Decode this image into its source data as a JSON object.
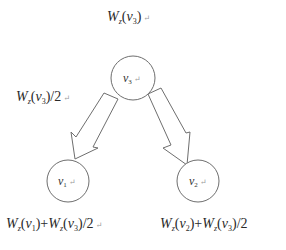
{
  "diagram": {
    "type": "tree-weight-distribution",
    "colors": {
      "stroke": "#6e6e6e",
      "text": "#2a2a2a",
      "background": "#ffffff",
      "return_mark": "#999999"
    },
    "nodes": [
      {
        "id": "v3",
        "base": "v",
        "sub": "3",
        "mark": "↵",
        "cx": 133,
        "cy": 78,
        "r": 22
      },
      {
        "id": "v1",
        "base": "v",
        "sub": "1",
        "mark": "↵",
        "cx": 68,
        "cy": 181,
        "r": 21
      },
      {
        "id": "v2",
        "base": "v",
        "sub": "2",
        "mark": "↵",
        "cx": 198,
        "cy": 181,
        "r": 21
      }
    ],
    "edges": [
      {
        "from": "v3",
        "to": "v1",
        "style": "hollow-block-arrow"
      },
      {
        "from": "v3",
        "to": "v2",
        "style": "hollow-block-arrow"
      }
    ],
    "labels": {
      "top": {
        "W": "W",
        "z": "z",
        "v": "v",
        "sub": "3",
        "text": "W_z(v_3)",
        "mark": "↵"
      },
      "edge_left": {
        "W": "W",
        "z": "z",
        "v": "v",
        "sub": "3",
        "suffix": "/2",
        "text": "W_z(v_3)/2",
        "mark": "↵"
      },
      "bottom_left": {
        "text": "W_z(v_1)+W_z(v_3)/2",
        "t1": {
          "W": "W",
          "z": "z",
          "v": "v",
          "sub": "1"
        },
        "plus": "+",
        "t2": {
          "W": "W",
          "z": "z",
          "v": "v",
          "sub": "3"
        },
        "suffix": "/2",
        "mark": "↵"
      },
      "bottom_right": {
        "text": "W_z(v_2)+W_z(v_3)/2",
        "t1": {
          "W": "W",
          "z": "z",
          "v": "v",
          "sub": "2"
        },
        "plus": "+",
        "t2": {
          "W": "W",
          "z": "z",
          "v": "v",
          "sub": "3"
        },
        "suffix": "/2"
      }
    }
  }
}
